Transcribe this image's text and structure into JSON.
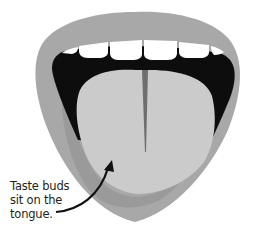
{
  "diagram": {
    "parts": [
      "lips",
      "upper-teeth",
      "mouth-interior",
      "tongue",
      "tongue-midline-groove"
    ],
    "annotation": {
      "lines": [
        "Taste buds",
        "sit on the",
        "tongue."
      ],
      "points_to": "tongue"
    },
    "colors": {
      "lip_outer": "#a8a8a8",
      "lip_lower_inner": "#9a9a9a",
      "mouth_interior": "#0d0d0d",
      "tongue": "#cbcbcb",
      "tongue_groove": "#6e6e6e",
      "teeth": "#ffffff",
      "arrow": "#111111",
      "text": "#231f20"
    }
  }
}
